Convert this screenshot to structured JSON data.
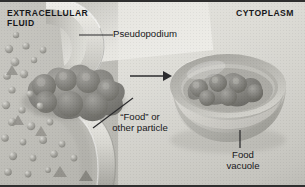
{
  "figure": {
    "name": "phagocytosis-diagram",
    "width_px": 305,
    "height_px": 187
  },
  "regions": {
    "extracellular": {
      "line1": "EXTRACELLULAR",
      "line2": "FLUID"
    },
    "cytoplasm": {
      "label": "CYTOPLASM"
    }
  },
  "labels": {
    "pseudopodium": "Pseudopodium",
    "particle_line1": "“Food” or",
    "particle_line2": "other particle",
    "vacuole_line1": "Food",
    "vacuole_line2": "vacuole"
  },
  "colors": {
    "extracellular_fluid": "#bdbcb6",
    "cytoplasm": "#ddddd7",
    "membrane_light": "#efeeea",
    "membrane_mid": "#b9b8b1",
    "membrane_shadow": "#8f8e88",
    "food_particle": "#7e7d79",
    "food_particle_light": "#9b9a95",
    "vacuole_rim": "#cfcec8",
    "leader_line": "#1b1b1d",
    "text": "#17171a",
    "border": "#2e2e2e"
  },
  "annotations": {
    "arrow": {
      "name": "process-arrow",
      "direction": "right",
      "meaning": "engulfed particle becomes food vacuole"
    },
    "leaders": [
      {
        "name": "pseudopodium-leader",
        "orientation": "horizontal"
      },
      {
        "name": "particle-leader",
        "orientation": "diagonal"
      },
      {
        "name": "vacuole-leader",
        "orientation": "vertical"
      }
    ]
  },
  "solutes": {
    "name": "extracellular-particles",
    "sphere_count": 27,
    "triangle_count": 5
  }
}
